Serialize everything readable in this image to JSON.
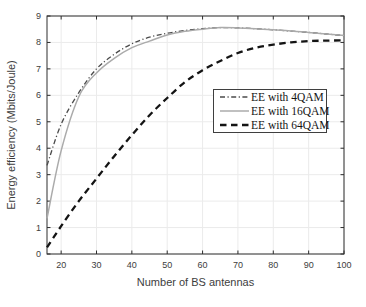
{
  "chart_data": {
    "type": "line",
    "title": "",
    "xlabel": "Number of BS antennas",
    "ylabel": "Energy efficiency (Mbits/Joule)",
    "xlim": [
      16,
      100
    ],
    "ylim": [
      0,
      9
    ],
    "xticks": [
      20,
      30,
      40,
      50,
      60,
      70,
      80,
      90,
      100
    ],
    "yticks": [
      0,
      1,
      2,
      3,
      4,
      5,
      6,
      7,
      8,
      9
    ],
    "grid": true,
    "legend_position": "middle-right",
    "x": [
      16,
      20,
      25,
      30,
      35,
      40,
      45,
      50,
      55,
      60,
      65,
      70,
      75,
      80,
      85,
      90,
      95,
      100
    ],
    "series": [
      {
        "name": "EE with 4QAM",
        "style": "dash-dot",
        "color": "#4b4b4b",
        "width": 1.3,
        "values": [
          3.35,
          4.9,
          6.1,
          7.0,
          7.55,
          7.95,
          8.2,
          8.35,
          8.45,
          8.52,
          8.56,
          8.55,
          8.52,
          8.48,
          8.43,
          8.38,
          8.32,
          8.26
        ]
      },
      {
        "name": "EE with 16QAM",
        "style": "solid",
        "color": "#ababab",
        "width": 1.5,
        "values": [
          1.35,
          3.9,
          5.95,
          6.85,
          7.4,
          7.8,
          8.05,
          8.28,
          8.42,
          8.5,
          8.56,
          8.55,
          8.52,
          8.48,
          8.43,
          8.38,
          8.32,
          8.26
        ]
      },
      {
        "name": "EE with 64QAM",
        "style": "dashed",
        "color": "#141414",
        "width": 2.3,
        "values": [
          0.25,
          1.05,
          2.0,
          2.85,
          3.7,
          4.5,
          5.25,
          5.9,
          6.5,
          6.95,
          7.3,
          7.6,
          7.8,
          7.92,
          8.0,
          8.05,
          8.07,
          8.08
        ]
      }
    ]
  },
  "axis_style": {
    "frame_color": "#2e2e2e",
    "tick_color": "#2e2e2e",
    "grid_color": "#ebebeb",
    "label_color": "#3d3d3d"
  }
}
